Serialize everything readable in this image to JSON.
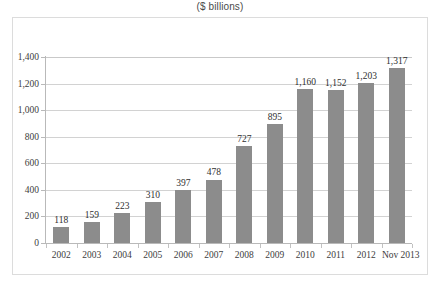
{
  "chart_data": {
    "type": "bar",
    "title": "($ billions)",
    "subtitle": "",
    "xlabel": "",
    "ylabel": "",
    "ylim": [
      0,
      1400
    ],
    "ytick_step": 200,
    "grid": true,
    "legend": "none",
    "bar_color": "#8c8c8c",
    "categories": [
      "2002",
      "2003",
      "2004",
      "2005",
      "2006",
      "2007",
      "2008",
      "2009",
      "2010",
      "2011",
      "2012",
      "Nov 2013"
    ],
    "values": [
      118,
      159,
      223,
      310,
      397,
      478,
      727,
      895,
      1160,
      1152,
      1203,
      1317
    ],
    "value_labels": [
      "118",
      "159",
      "223",
      "310",
      "397",
      "478",
      "727",
      "895",
      "1,160",
      "1,152",
      "1,203",
      "1,317"
    ],
    "ytick_labels": [
      "1,400",
      "1,200",
      "1,000",
      "800",
      "600",
      "400",
      "200",
      "0"
    ],
    "ytick_values": [
      1400,
      1200,
      1000,
      800,
      600,
      400,
      200,
      0
    ]
  }
}
